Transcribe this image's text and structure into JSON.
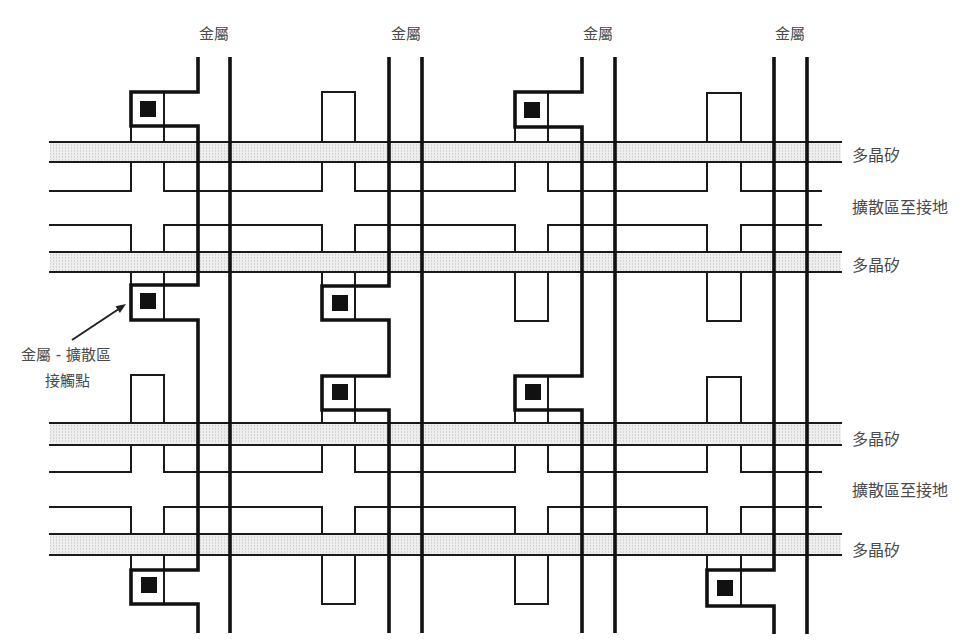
{
  "diagram": {
    "metal_labels": [
      "金屬",
      "金屬",
      "金屬",
      "金屬"
    ],
    "row_labels": [
      "多晶矽",
      "擴散區至接地",
      "多晶矽",
      "多晶矽",
      "擴散區至接地",
      "多晶矽"
    ],
    "callout": {
      "line1": "金屬 - 擴散區",
      "line2": "接觸點"
    }
  },
  "colors": {
    "line": "#111111",
    "polysilicon_fill": "#eeeeee",
    "contact": "#111111",
    "text": "#4a4a4a",
    "background": "#ffffff"
  }
}
